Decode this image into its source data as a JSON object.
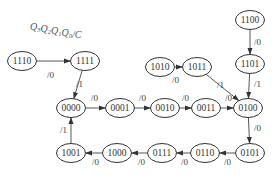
{
  "title": {
    "parts": [
      {
        "t": "Q",
        "sub": "3"
      },
      {
        "t": "Q",
        "sub": "2"
      },
      {
        "t": "Q",
        "sub": "1"
      },
      {
        "t": "Q",
        "sub": "0"
      },
      {
        "t": "/C",
        "sub": ""
      }
    ]
  },
  "nodes": [
    {
      "id": "1110",
      "x": 22,
      "y": 61
    },
    {
      "id": "1111",
      "x": 85,
      "y": 61
    },
    {
      "id": "1100",
      "x": 250,
      "y": 20
    },
    {
      "id": "1101",
      "x": 250,
      "y": 64
    },
    {
      "id": "1010",
      "x": 160,
      "y": 67
    },
    {
      "id": "1011",
      "x": 197,
      "y": 67
    },
    {
      "id": "0000",
      "x": 71,
      "y": 108
    },
    {
      "id": "0001",
      "x": 120,
      "y": 108
    },
    {
      "id": "0010",
      "x": 165,
      "y": 108
    },
    {
      "id": "0011",
      "x": 206,
      "y": 108
    },
    {
      "id": "0100",
      "x": 248,
      "y": 108
    },
    {
      "id": "1001",
      "x": 71,
      "y": 153
    },
    {
      "id": "1000",
      "x": 117,
      "y": 153
    },
    {
      "id": "0111",
      "x": 162,
      "y": 153
    },
    {
      "id": "0110",
      "x": 205,
      "y": 153
    },
    {
      "id": "0101",
      "x": 250,
      "y": 153
    }
  ],
  "edges": [
    {
      "from": "1110",
      "to": "1111",
      "label": "/0",
      "lx": 47,
      "ly": 78
    },
    {
      "from": "1111",
      "to": "0000",
      "label": "/1",
      "lx": 76,
      "ly": 87
    },
    {
      "from": "1100",
      "to": "1101",
      "label": "/0",
      "lx": 254,
      "ly": 45
    },
    {
      "from": "1010",
      "to": "1011",
      "label": "/0",
      "lx": 172,
      "ly": 83
    },
    {
      "from": "1011",
      "to": "0100",
      "label": "/1",
      "lx": 217,
      "ly": 88
    },
    {
      "from": "1101",
      "to": "0100",
      "label": "/1",
      "lx": 254,
      "ly": 87
    },
    {
      "from": "0000",
      "to": "0001",
      "label": "/0",
      "lx": 91,
      "ly": 101
    },
    {
      "from": "0001",
      "to": "0010",
      "label": "/0",
      "lx": 139,
      "ly": 101
    },
    {
      "from": "0010",
      "to": "0011",
      "label": "/0",
      "lx": 182,
      "ly": 101
    },
    {
      "from": "0011",
      "to": "0100",
      "label": "/0",
      "lx": 225,
      "ly": 101
    },
    {
      "from": "0100",
      "to": "0101",
      "label": "/0",
      "lx": 254,
      "ly": 131
    },
    {
      "from": "0101",
      "to": "0110",
      "label": "/0",
      "lx": 224,
      "ly": 165
    },
    {
      "from": "0110",
      "to": "0111",
      "label": "/0",
      "lx": 181,
      "ly": 165
    },
    {
      "from": "0111",
      "to": "1000",
      "label": "/0",
      "lx": 138,
      "ly": 165
    },
    {
      "from": "1000",
      "to": "1001",
      "label": "/0",
      "lx": 92,
      "ly": 165
    },
    {
      "from": "1001",
      "to": "0000",
      "label": "/1",
      "lx": 60,
      "ly": 133
    }
  ]
}
